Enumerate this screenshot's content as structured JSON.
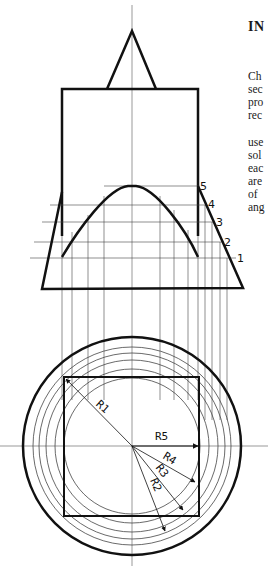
{
  "text": {
    "heading": "IN",
    "paragraph1": [
      "Ch",
      "sec",
      "pro",
      "rec"
    ],
    "paragraph2": [
      "use",
      "sol",
      "eac",
      "are",
      "of",
      "ang"
    ]
  },
  "diagram": {
    "section_labels": [
      "1",
      "2",
      "3",
      "4",
      "5"
    ],
    "radius_labels": [
      "R1",
      "R2",
      "R3",
      "R4",
      "R5"
    ],
    "colors": {
      "stroke": "#111111",
      "thin": "#444444",
      "background": "#ffffff"
    }
  }
}
